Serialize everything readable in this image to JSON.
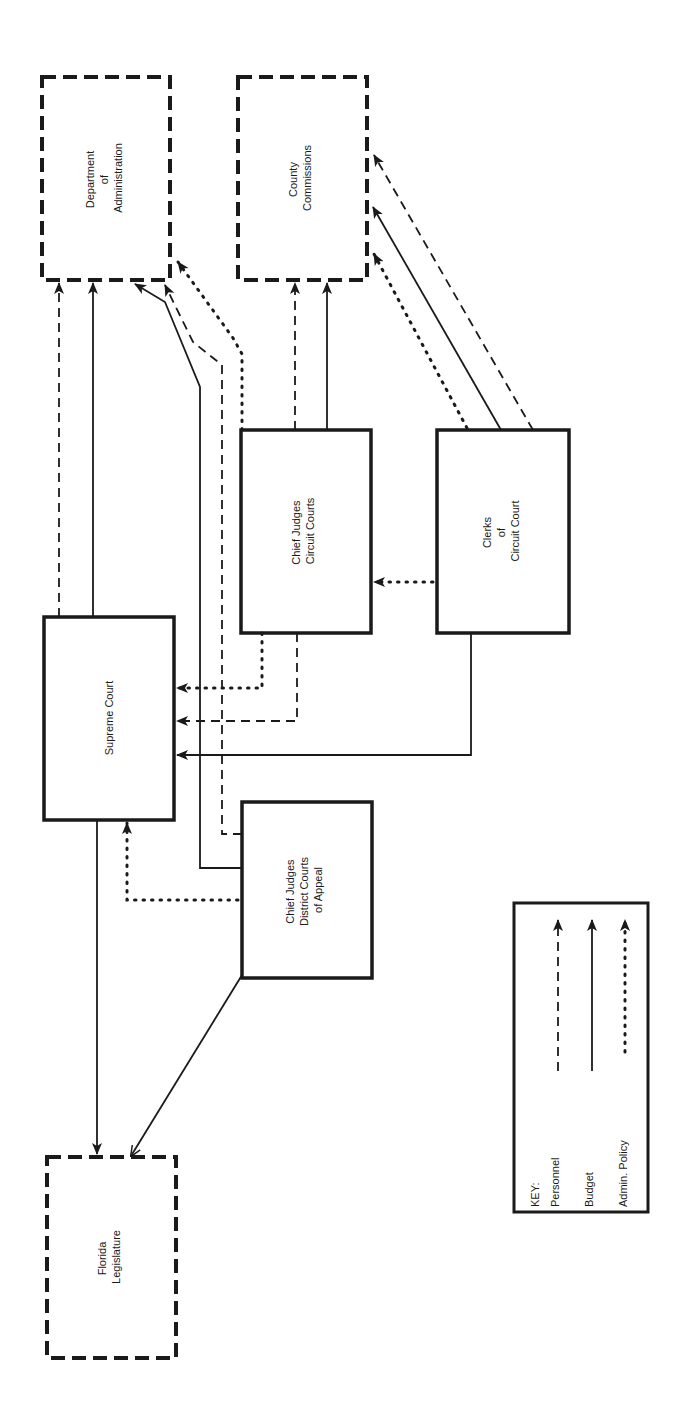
{
  "diagram": {
    "orientation": "rotated-90-ccw",
    "colors": {
      "ink": "#1a1a1a",
      "background": "#ffffff"
    },
    "nodes": {
      "dept_admin": {
        "lines": [
          "Department",
          "of",
          "Administration"
        ],
        "border": "dashed"
      },
      "county_commissions": {
        "lines": [
          "County",
          "Commissions"
        ],
        "border": "dashed"
      },
      "supreme_court": {
        "lines": [
          "Supreme Court"
        ],
        "border": "solid"
      },
      "chief_judges_circuit": {
        "lines": [
          "Chief Judges",
          "Circuit Courts"
        ],
        "border": "solid"
      },
      "clerks_circuit": {
        "lines": [
          "Clerks",
          "of",
          "Circuit Court"
        ],
        "border": "solid"
      },
      "chief_judges_district": {
        "lines": [
          "Chief Judges",
          "District Courts",
          "of Appeal"
        ],
        "border": "solid"
      },
      "florida_legislature": {
        "lines": [
          "Florida",
          "Legislature"
        ],
        "border": "dashed"
      }
    },
    "edges": [
      {
        "from": "Supreme Court",
        "to": "Department of Administration",
        "type": "Personnel"
      },
      {
        "from": "Supreme Court",
        "to": "Department of Administration",
        "type": "Budget"
      },
      {
        "from": "Chief Judges District Courts of Appeal",
        "to": "Department of Administration",
        "type": "Budget"
      },
      {
        "from": "Chief Judges District Courts of Appeal",
        "to": "Department of Administration",
        "type": "Personnel"
      },
      {
        "from": "Chief Judges Circuit Courts",
        "to": "Department of Administration",
        "type": "Admin. Policy"
      },
      {
        "from": "Chief Judges Circuit Courts",
        "to": "County Commissions",
        "type": "Personnel"
      },
      {
        "from": "Chief Judges Circuit Courts",
        "to": "County Commissions",
        "type": "Budget"
      },
      {
        "from": "Clerks of Circuit Court",
        "to": "County Commissions",
        "type": "Admin. Policy"
      },
      {
        "from": "Clerks of Circuit Court",
        "to": "County Commissions",
        "type": "Budget"
      },
      {
        "from": "Clerks of Circuit Court",
        "to": "County Commissions",
        "type": "Personnel"
      },
      {
        "from": "Clerks of Circuit Court",
        "to": "Chief Judges Circuit Courts",
        "type": "Admin. Policy"
      },
      {
        "from": "Chief Judges Circuit Courts",
        "to": "Supreme Court",
        "type": "Admin. Policy"
      },
      {
        "from": "Chief Judges Circuit Courts",
        "to": "Supreme Court",
        "type": "Personnel"
      },
      {
        "from": "Clerks of Circuit Court",
        "to": "Supreme Court",
        "type": "Budget"
      },
      {
        "from": "Chief Judges District Courts of Appeal",
        "to": "Supreme Court",
        "type": "Admin. Policy"
      },
      {
        "from": "Supreme Court",
        "to": "Florida Legislature",
        "type": "Budget"
      },
      {
        "from": "Chief Judges District Courts of Appeal",
        "to": "Florida Legislature",
        "type": "Budget"
      }
    ],
    "key": {
      "title": "KEY:",
      "items": [
        {
          "label": "Personnel",
          "style": "dashed"
        },
        {
          "label": "Budget",
          "style": "solid"
        },
        {
          "label": "Admin. Policy",
          "style": "dotted"
        }
      ]
    }
  }
}
